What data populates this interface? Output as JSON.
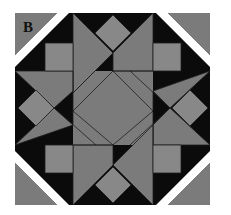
{
  "figure": {
    "label": "B",
    "label_pos": {
      "x": 23,
      "y": 19
    },
    "colors": {
      "background": "#ffffff",
      "black": "#0b0b0b",
      "gray": "#7b7b7b",
      "light_gray": "#888888",
      "outline": "#1e1e1e",
      "band": "#ffffff"
    },
    "block": {
      "x": 15,
      "y": 13,
      "w": 195,
      "h": 192
    },
    "corner_triangles": [
      {
        "name": "corner-triangle-top-left",
        "points": "15,13 57,13 15,55"
      },
      {
        "name": "corner-triangle-top-right",
        "points": "168,13 210,13 210,55"
      },
      {
        "name": "corner-triangle-bottom-left",
        "points": "15,163 15,205 57,205"
      },
      {
        "name": "corner-triangle-bottom-right",
        "points": "210,163 210,205 168,205"
      }
    ],
    "white_bands": [
      {
        "name": "band-top-left",
        "points": "57,13 69,13 15,67 15,55"
      },
      {
        "name": "band-top-right",
        "points": "156,13 168,13 210,55 210,67"
      },
      {
        "name": "band-bottom-left",
        "points": "15,151 15,163 57,205 69,205"
      },
      {
        "name": "band-bottom-right",
        "points": "210,151 210,163 168,205 156,205"
      }
    ],
    "corner_squares": [
      {
        "name": "square-top-left",
        "points": "45,43 73,43 73,71 45,71"
      },
      {
        "name": "square-top-right",
        "points": "153,43 181,43 181,71 153,71"
      },
      {
        "name": "square-bottom-left",
        "points": "45,145 73,145 73,173 45,173"
      },
      {
        "name": "square-bottom-right",
        "points": "153,145 181,145 181,173 153,173"
      }
    ],
    "diamonds": [
      {
        "name": "diamond-top",
        "points": "113,15 131,33 113,51 95,33"
      },
      {
        "name": "diamond-bottom",
        "points": "113,167 131,185 113,203 95,185"
      },
      {
        "name": "diamond-left",
        "points": "18,108 36,90 54,108 36,126"
      },
      {
        "name": "diamond-right",
        "points": "172,108 190,90 208,108 190,126"
      }
    ],
    "star_triangles": [
      {
        "name": "star-top-left-triangle",
        "points": "73,13 113,53 73,93"
      },
      {
        "name": "star-top-right-triangle",
        "points": "153,13 153,71 113,71 113,53"
      },
      {
        "name": "star-right-top-triangle",
        "points": "210,71 170,108 153,91"
      },
      {
        "name": "star-right-bottom-triangle",
        "points": "210,145 153,145 153,125 170,108"
      },
      {
        "name": "star-bottom-right-triangle",
        "points": "153,205 113,165 153,125"
      },
      {
        "name": "star-bottom-left-triangle",
        "points": "73,205 73,145 113,145 113,165"
      },
      {
        "name": "star-left-bottom-triangle",
        "points": "15,145 54,108 73,125"
      },
      {
        "name": "star-left-top-triangle",
        "points": "15,71 73,71 73,91 54,108"
      }
    ],
    "center_fill": {
      "name": "center-field",
      "points": "73,71 153,71 153,145 73,145"
    },
    "octagon": {
      "name": "center-octagon",
      "points": "96,86 130,86 153,108 153,118 130,140 96,140 73,118 73,100"
    },
    "pinwheel_lines": [
      {
        "name": "pinwheel-line-1",
        "d": "M113,53 L73,93"
      },
      {
        "name": "pinwheel-line-2",
        "d": "M113,71 L153,71"
      },
      {
        "name": "pinwheel-line-3",
        "d": "M130,71 L170,108"
      },
      {
        "name": "pinwheel-line-4",
        "d": "M153,91 L153,145"
      },
      {
        "name": "pinwheel-line-5",
        "d": "M170,108 L130,145"
      },
      {
        "name": "pinwheel-line-6",
        "d": "M113,145 L73,145"
      },
      {
        "name": "pinwheel-line-7",
        "d": "M96,145 L54,108"
      },
      {
        "name": "pinwheel-line-8",
        "d": "M73,125 L73,71"
      },
      {
        "name": "octagon-edge-tl",
        "d": "M113,71 L73,111"
      },
      {
        "name": "octagon-edge-tr",
        "d": "M113,71 L153,111"
      },
      {
        "name": "octagon-edge-br",
        "d": "M153,111 L113,145"
      },
      {
        "name": "octagon-edge-bl",
        "d": "M73,111 L113,145"
      }
    ]
  }
}
